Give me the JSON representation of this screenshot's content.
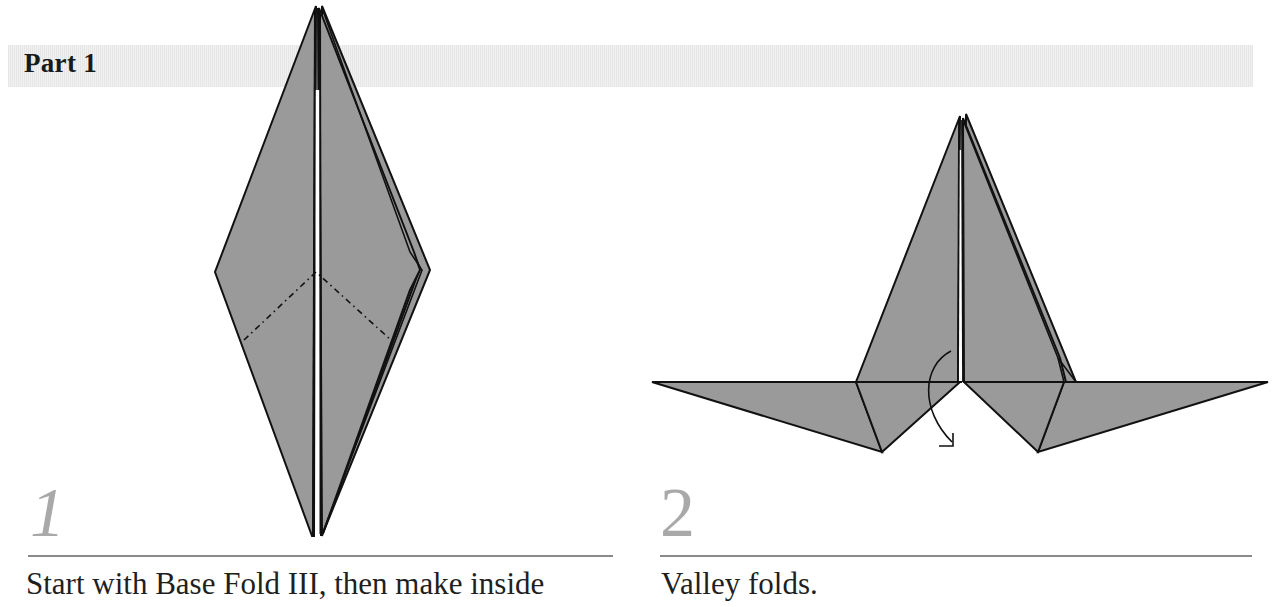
{
  "header": {
    "title": "Part 1"
  },
  "steps": [
    {
      "number": "1",
      "caption": "Start with Base Fold III, then make inside"
    },
    {
      "number": "2",
      "caption": "Valley folds."
    }
  ],
  "colors": {
    "paper_fill": "#9a9a9a",
    "outline": "#111111",
    "step_number": "#a9a9a9",
    "rule": "#8a8a8a",
    "band": "#ececec"
  }
}
